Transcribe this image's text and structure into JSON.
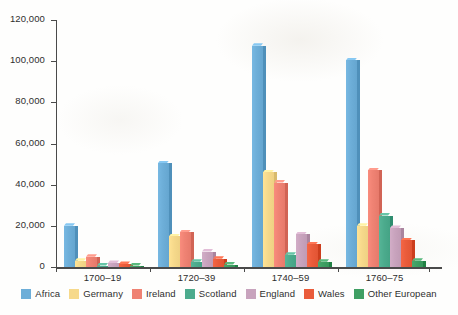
{
  "chart_data": {
    "type": "bar",
    "title": "",
    "subtitle": "",
    "xlabel": "",
    "ylabel": "",
    "ylim": [
      0,
      120000
    ],
    "ytick_labels": [
      "120,000",
      "100,000",
      "80,000",
      "60,000",
      "40,000",
      "20,000",
      "0"
    ],
    "ytick_values": [
      120000,
      100000,
      80000,
      60000,
      40000,
      20000,
      0
    ],
    "grid": false,
    "legend_position": "bottom",
    "categories": [
      "1700–19",
      "1720–39",
      "1740–59",
      "1760–75"
    ],
    "series": [
      {
        "name": "Africa",
        "color": "#6daed8",
        "values": [
          20000,
          50500,
          107500,
          100500
        ]
      },
      {
        "name": "Germany",
        "color": "#f6d98b",
        "values": [
          3000,
          15000,
          46000,
          20000
        ]
      },
      {
        "name": "Ireland",
        "color": "#ef8273",
        "values": [
          5000,
          17000,
          41000,
          47000
        ]
      },
      {
        "name": "Scotland",
        "color": "#4cab8d",
        "values": [
          600,
          2500,
          6000,
          25000
        ]
      },
      {
        "name": "England",
        "color": "#c8a3bd",
        "values": [
          2000,
          7500,
          16000,
          19000
        ]
      },
      {
        "name": "Wales",
        "color": "#ea5c3b",
        "values": [
          1500,
          4000,
          11000,
          13000
        ]
      },
      {
        "name": "Other European",
        "color": "#3f9f63",
        "values": [
          600,
          1200,
          2500,
          3000
        ]
      }
    ]
  },
  "legend": {
    "items": [
      {
        "label": "Africa"
      },
      {
        "label": "Germany"
      },
      {
        "label": "Ireland"
      },
      {
        "label": "Scotland"
      },
      {
        "label": "England"
      },
      {
        "label": "Wales"
      },
      {
        "label": "Other European"
      }
    ]
  }
}
